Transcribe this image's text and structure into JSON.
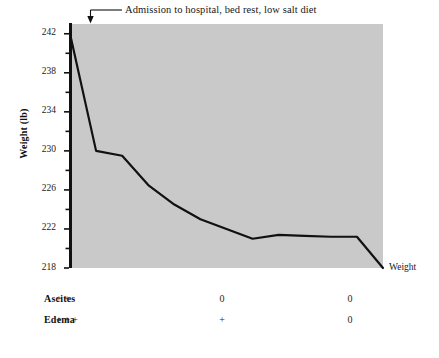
{
  "chart_data": {
    "type": "line",
    "title": "",
    "xlabel": "",
    "ylabel": "Weight (lb)",
    "ylim": [
      218,
      243
    ],
    "ytick_labels": [
      "242",
      "238",
      "234",
      "230",
      "226",
      "222",
      "218"
    ],
    "ytick_values": [
      242,
      238,
      234,
      230,
      226,
      222,
      218
    ],
    "minor_tick_values": [
      240,
      236,
      232,
      228,
      224,
      220
    ],
    "grid": false,
    "plot_background": "#c9c9c9",
    "line_color": "#111111",
    "legend_position": "right-inline",
    "series": [
      {
        "name": "Weight",
        "x": [
          0,
          1,
          2,
          3,
          4,
          5,
          6,
          7,
          8,
          9,
          10,
          11,
          12
        ],
        "values": [
          242.0,
          230.0,
          229.5,
          226.5,
          224.5,
          223.0,
          222.0,
          221.0,
          221.4,
          221.3,
          221.2,
          221.2,
          218.0
        ]
      }
    ],
    "annotations": [
      {
        "text": "Admission to hospital, bed rest, low salt diet",
        "points_to_x": 0,
        "points_to_y": 242.0
      }
    ]
  },
  "series_label": "Weight",
  "status_table": {
    "rows": [
      {
        "label": "Ascites",
        "values": [
          "+ +",
          "0",
          "0"
        ]
      },
      {
        "label": "Edema",
        "values": [
          "+ + +",
          "+",
          "0"
        ]
      }
    ]
  }
}
